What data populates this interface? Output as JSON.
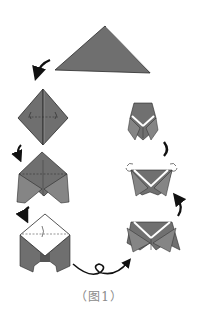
{
  "figure": {
    "caption": "（图1）",
    "corner_mark": "",
    "colors": {
      "paper_dark": "#6e6e6e",
      "paper_mid": "#7d7d7d",
      "paper_light": "#959595",
      "paper_white": "#ffffff",
      "outline": "#2a2a2a",
      "arrow": "#111111",
      "caption": "#8a8a8a"
    },
    "steps": [
      {
        "id": 1,
        "name": "triangle",
        "description": "Paper folded into a large triangle"
      },
      {
        "id": 2,
        "name": "square-base-folds",
        "description": "Diamond with left/right corner fold arrows and center crease"
      },
      {
        "id": 3,
        "name": "flaps-down",
        "description": "Side flaps folded down forming legs"
      },
      {
        "id": 4,
        "name": "top-flap-folded",
        "description": "Top layer folded down along dashed line (white side)"
      },
      {
        "id": 5,
        "name": "turn-over",
        "description": "Model turned over (loop arrow)"
      },
      {
        "id": 6,
        "name": "v-collar",
        "description": "White V-shaped collar shown"
      },
      {
        "id": 7,
        "name": "corners-folded-back",
        "description": "Top corners folded back with arrows"
      },
      {
        "id": 8,
        "name": "finished-cicada",
        "description": "Finished cicada shape"
      }
    ]
  }
}
